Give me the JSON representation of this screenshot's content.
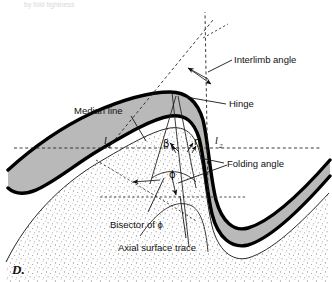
{
  "figure": {
    "panel_id": "D.",
    "top_cropped_text": "by fold tightness",
    "colors": {
      "ink": "#000000",
      "gray_band": "#b9b9b9",
      "stipple": "#f2f2f2",
      "white": "#ffffff",
      "dashed_guide": "#252525"
    }
  },
  "labels": {
    "interlimb_angle": "Interlimb angle",
    "hinge": "Hinge",
    "median_line": "Median line",
    "folding_angle": "Folding angle",
    "bisector_of_phi": "Bisector of ϕ",
    "axial_surface_trace": "Axial surface trace"
  },
  "symbols": {
    "beta": "β",
    "eta": "η",
    "phi": "ϕ",
    "limb_1": "l",
    "limb_1_sub": "1",
    "limb_2": "l",
    "limb_2_sub": "2"
  }
}
